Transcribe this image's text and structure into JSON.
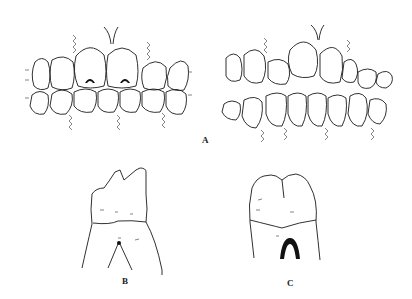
{
  "figure": {
    "panels": [
      {
        "id": "A",
        "label": "A",
        "description": "Two frontal views of dental arches in occlusion; left view shows upper central incisors with dark cervical lesions, right view shows normal arches"
      },
      {
        "id": "B",
        "label": "B",
        "description": "Single molar tooth, buccal view, worn cusps with root furcation"
      },
      {
        "id": "C",
        "label": "C",
        "description": "Single molar/premolar tooth crown with dark cervical notch"
      }
    ]
  }
}
